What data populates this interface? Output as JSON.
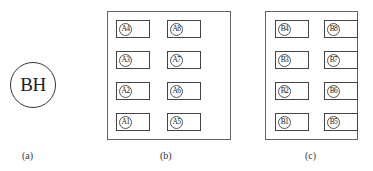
{
  "panel_a": {
    "symbol": "BH",
    "caption": "(a)"
  },
  "panel_b": {
    "caption": "(b)",
    "left_column": [
      "A4",
      "A3",
      "A2",
      "A1"
    ],
    "right_column": [
      "A8",
      "A7",
      "A6",
      "A5"
    ]
  },
  "panel_c": {
    "caption": "(c)",
    "left_column": [
      "B4",
      "B3",
      "B2",
      "B1"
    ],
    "right_column": [
      "B8",
      "B7",
      "B6",
      "B5"
    ]
  }
}
